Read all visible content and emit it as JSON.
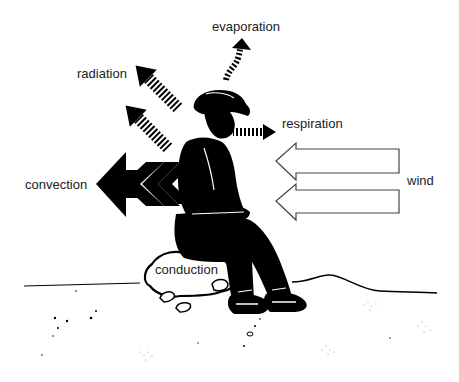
{
  "diagram": {
    "title": "",
    "labels": {
      "evaporation": "evaporation",
      "radiation": "radiation",
      "respiration": "respiration",
      "convection": "convection",
      "wind": "wind",
      "conduction": "conduction"
    },
    "colors": {
      "ink": "#000000",
      "text": "#222222",
      "background": "#ffffff"
    }
  }
}
